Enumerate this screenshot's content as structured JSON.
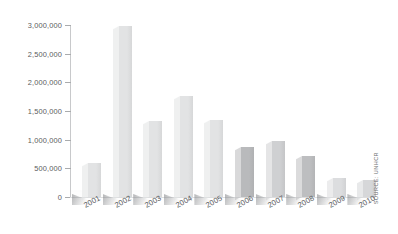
{
  "chart_data": {
    "type": "bar",
    "title": "",
    "subtitle": "",
    "xlabel": "",
    "ylabel": "",
    "categories": [
      "2001",
      "2002",
      "2003",
      "2004",
      "2005",
      "2006",
      "2007",
      "2008",
      "2009",
      "2010"
    ],
    "values": [
      590000,
      2980000,
      1320000,
      1760000,
      1340000,
      870000,
      975000,
      715000,
      330000,
      300000
    ],
    "series": [
      {
        "name": "Returns",
        "values": [
          590000,
          2980000,
          1320000,
          1760000,
          1340000,
          870000,
          975000,
          715000,
          330000,
          300000
        ]
      }
    ],
    "bar_colors": [
      "#e2e3e4",
      "#e2e3e4",
      "#e2e3e4",
      "#e2e3e4",
      "#e2e3e4",
      "#b9babc",
      "#cfd0d2",
      "#bdbec0",
      "#dcdddf",
      "#d6d7d9"
    ],
    "ylim": [
      0,
      3000000
    ],
    "ytick_values": [
      0,
      500000,
      1000000,
      1500000,
      2000000,
      2500000,
      3000000
    ],
    "ytick_labels": [
      "0",
      "500,000",
      "1,000,000",
      "1,500,000",
      "2,000,000",
      "2,500,000",
      "3,000,000"
    ],
    "grid": false,
    "legend": "none",
    "annotations": [
      "SOURCE: UNHCR"
    ],
    "edge_fragment": ")"
  },
  "axes": {
    "y": {
      "ticks": [
        {
          "label": "3,000,000",
          "value": 3000000
        },
        {
          "label": "2,500,000",
          "value": 2500000
        },
        {
          "label": "2,000,000",
          "value": 2000000
        },
        {
          "label": "1,500,000",
          "value": 1500000
        },
        {
          "label": "1,000,000",
          "value": 1000000
        },
        {
          "label": "500,000",
          "value": 500000
        },
        {
          "label": "0",
          "value": 0
        }
      ]
    },
    "x": {
      "ticks": [
        {
          "label": "2001"
        },
        {
          "label": "2002"
        },
        {
          "label": "2003"
        },
        {
          "label": "2004"
        },
        {
          "label": "2005"
        },
        {
          "label": "2006"
        },
        {
          "label": "2007"
        },
        {
          "label": "2008"
        },
        {
          "label": "2009"
        },
        {
          "label": "2010"
        }
      ]
    }
  },
  "source": {
    "text": "SOURCE: UNHCR"
  },
  "edge": {
    "fragment": ")"
  },
  "colors": {
    "axis": "#c8c9cb",
    "tick": "#a9abad",
    "text": "#56585b",
    "bar_light": "#e2e3e4",
    "bar_dark": "#b9babc",
    "background": "#ffffff"
  }
}
